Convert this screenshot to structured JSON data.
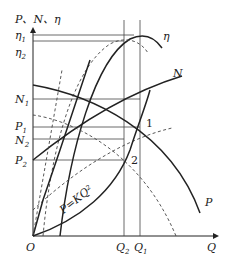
{
  "diagram": {
    "type": "pump characteristic curves (P, N, η vs Q)",
    "y_axis_label": "P、N、η",
    "x_axis_label": "Q",
    "origin_label": "O",
    "y_ticks": [
      {
        "main": "η",
        "sub": "1"
      },
      {
        "main": "η",
        "sub": "2"
      },
      {
        "main": "N",
        "sub": "1"
      },
      {
        "main": "P",
        "sub": "1"
      },
      {
        "main": "N",
        "sub": "2"
      },
      {
        "main": "P",
        "sub": "2"
      }
    ],
    "x_ticks": [
      {
        "main": "Q",
        "sub": "2"
      },
      {
        "main": "Q",
        "sub": "1"
      }
    ],
    "curve_labels": {
      "eta": "η",
      "N": "N",
      "P": "P",
      "system": "P=KQ²"
    },
    "point_labels": [
      "1",
      "2"
    ]
  }
}
